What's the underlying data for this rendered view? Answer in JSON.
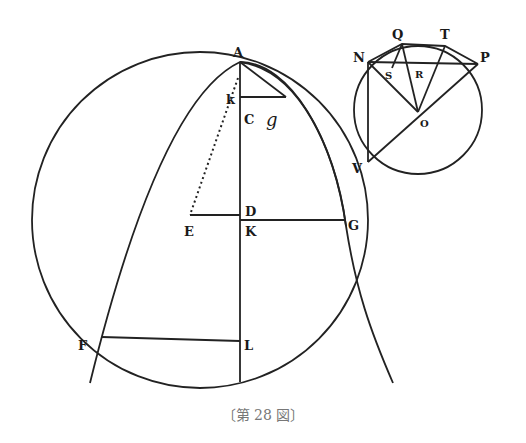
{
  "figure": {
    "caption": "〔第 28 図〕",
    "main_diagram": {
      "labels": {
        "A": "A",
        "k": "k",
        "C": "C",
        "g": "g",
        "D": "D",
        "E": "E",
        "K": "K",
        "G": "G",
        "F": "F",
        "L": "L"
      }
    },
    "inset_diagram": {
      "labels": {
        "Q": "Q",
        "T": "T",
        "N": "N",
        "P": "P",
        "S": "S",
        "R": "R",
        "O": "O",
        "V": "V"
      }
    },
    "colors": {
      "ink": "#222222",
      "caption": "#777777",
      "background": "#ffffff"
    }
  }
}
